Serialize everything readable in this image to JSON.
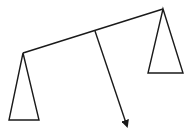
{
  "diagram": {
    "title": "",
    "elements": [
      {
        "name": "beam",
        "type": "line"
      },
      {
        "name": "left-support",
        "type": "triangle"
      },
      {
        "name": "right-support",
        "type": "triangle"
      },
      {
        "name": "force-arrow",
        "type": "arrow"
      }
    ],
    "colors": {
      "stroke": "#1a1a1a",
      "background": "#ffffff"
    }
  }
}
